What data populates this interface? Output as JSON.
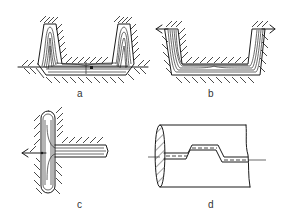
{
  "figures": [
    {
      "id": "a",
      "label": "a",
      "description": "Die cross-section with two tall flanges and web; grain flow lines, parting line with flash"
    },
    {
      "id": "b",
      "label": "b",
      "description": "U-channel die cross-section with grain flow lines; parting line at top corners"
    },
    {
      "id": "c",
      "label": "c",
      "description": "T-section forging with vertical rib and horizontal arm; parting line through junction"
    },
    {
      "id": "d",
      "label": "d",
      "description": "Cylindrical forging with end flange, stepped (broken) parting line"
    }
  ],
  "colors": {
    "ink": "#1a1a1a",
    "background": "#ffffff"
  }
}
